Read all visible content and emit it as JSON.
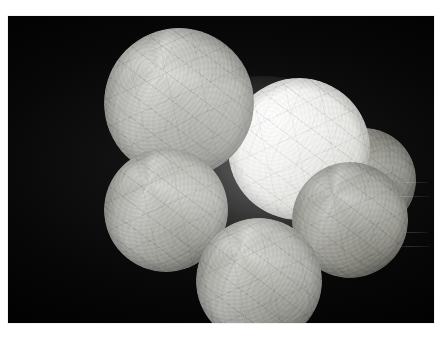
{
  "image": {
    "domain": "Natural-Image",
    "title": "Cluster of illuminated crumpled-paper spheres",
    "subject": "Six overlapping spherical paper lanterns glowing against a black background",
    "background_color": "#000000",
    "page_color": "#ffffff",
    "canvas": {
      "width": 448,
      "height": 343
    },
    "photo_plate": {
      "left": 8,
      "top": 16,
      "width": 426,
      "height": 307
    },
    "caption": "",
    "lighting": "Internal illumination, brightest at the central sphere, falling off to dark rims",
    "palette": {
      "brightest_highlight": "#ffffff",
      "mid_paper": "#b9b9b4",
      "shadow_paper": "#42423f",
      "background": "#000000",
      "border": "#ffffff"
    },
    "spheres": [
      {
        "name": "top-left-large",
        "label": "Large upper-left sphere",
        "left": 104,
        "top": 28,
        "size": 148,
        "tone": "#a9a9a4",
        "brightness": 0.66,
        "z": 4
      },
      {
        "name": "center-bright",
        "label": "Bright central sphere",
        "left": 228,
        "top": 78,
        "size": 142,
        "tone": "#ebebe8",
        "brightness": 0.95,
        "z": 3
      },
      {
        "name": "left-mid",
        "label": "Left middle sphere",
        "left": 104,
        "top": 148,
        "size": 122,
        "tone": "#a3a39e",
        "brightness": 0.62,
        "z": 5
      },
      {
        "name": "bottom-center",
        "label": "Lower centre sphere",
        "left": 196,
        "top": 218,
        "size": 124,
        "tone": "#9e9e99",
        "brightness": 0.58,
        "z": 6
      },
      {
        "name": "right-front",
        "label": "Right foreground sphere",
        "left": 292,
        "top": 162,
        "size": 116,
        "tone": "#919189",
        "brightness": 0.54,
        "z": 5
      },
      {
        "name": "right-back",
        "label": "Right rear dark sphere",
        "left": 312,
        "top": 128,
        "size": 104,
        "tone": "#80807a",
        "brightness": 0.44,
        "z": 2
      }
    ],
    "streaks": [
      {
        "left": 398,
        "top": 182,
        "width": 30
      },
      {
        "left": 392,
        "top": 196,
        "width": 38
      },
      {
        "left": 400,
        "top": 232,
        "width": 28
      },
      {
        "left": 396,
        "top": 246,
        "width": 34
      }
    ]
  }
}
